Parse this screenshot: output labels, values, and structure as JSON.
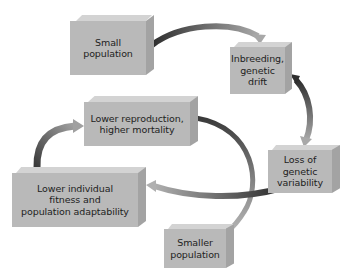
{
  "diagram": {
    "type": "cycle",
    "title": "",
    "nodes": [
      {
        "id": "small_population",
        "label": "Small population",
        "lines": [
          "Small",
          "population"
        ]
      },
      {
        "id": "inbreeding",
        "label": "Inbreeding, genetic drift",
        "lines": [
          "Inbreeding,",
          "genetic",
          "drift"
        ]
      },
      {
        "id": "loss_variability",
        "label": "Loss of genetic variability",
        "lines": [
          "Loss of",
          "genetic",
          "variability"
        ]
      },
      {
        "id": "lower_fitness",
        "label": "Lower individual fitness and population adaptability",
        "lines": [
          "Lower individual",
          "fitness and",
          "population adaptability"
        ]
      },
      {
        "id": "lower_reproduction",
        "label": "Lower reproduction, higher mortality",
        "lines": [
          "Lower reproduction,",
          "higher mortality"
        ]
      },
      {
        "id": "smaller_population",
        "label": "Smaller population",
        "lines": [
          "Smaller",
          "population"
        ]
      }
    ],
    "edges": [
      {
        "from": "small_population",
        "to": "inbreeding"
      },
      {
        "from": "inbreeding",
        "to": "loss_variability"
      },
      {
        "from": "loss_variability",
        "to": "lower_fitness"
      },
      {
        "from": "lower_fitness",
        "to": "lower_reproduction"
      },
      {
        "from": "lower_reproduction",
        "to": "smaller_population"
      }
    ],
    "colors": {
      "box_front": "#b9b9b9",
      "box_top": "#d3d3d3",
      "box_side": "#a3a3a3",
      "arrow_dark": "#3a3a3a",
      "arrow_light": "#b5b5b5",
      "background": "#ffffff"
    }
  }
}
